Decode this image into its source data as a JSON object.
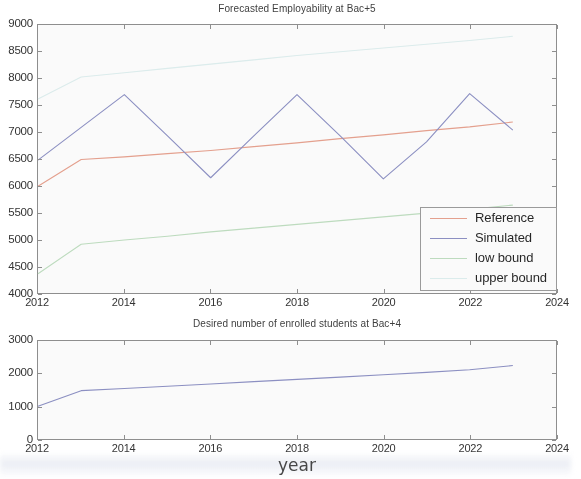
{
  "figure": {
    "background_color": "#ffffff",
    "axis_color": "#8d8d8d",
    "text_color": "#2e2e2e",
    "xaxis_label": "year"
  },
  "colors": {
    "reference": "#e8a08d",
    "simulated": "#8b8fc4",
    "low_bound": "#bfdfc0",
    "upper_bound": "#dff0f0"
  },
  "legend": {
    "items": [
      {
        "label": "Reference",
        "color_key": "reference"
      },
      {
        "label": "Simulated",
        "color_key": "simulated"
      },
      {
        "label": "low bound",
        "color_key": "low_bound"
      },
      {
        "label": "upper bound",
        "color_key": "upper_bound"
      }
    ]
  },
  "chart_data": [
    {
      "id": "top",
      "type": "line",
      "title": "Forecasted Employability at Bac+5",
      "xlabel": "",
      "ylabel": "",
      "xlim": [
        2012,
        2024
      ],
      "ylim": [
        4000,
        9000
      ],
      "xticks": [
        2012,
        2014,
        2016,
        2018,
        2020,
        2022,
        2024
      ],
      "xtick_labels": [
        "2012",
        "2014",
        "2016",
        "2018",
        "2020",
        "2022",
        "2024"
      ],
      "yticks": [
        4000,
        4500,
        5000,
        5500,
        6000,
        6500,
        7000,
        7500,
        8000,
        8500,
        9000
      ],
      "ytick_labels": [
        "4000",
        "4500",
        "5000",
        "5500",
        "6000",
        "6500",
        "7000",
        "7500",
        "8000",
        "8500",
        "9000"
      ],
      "grid": false,
      "legend_position": "lower right",
      "x": [
        2012,
        2013,
        2014,
        2015,
        2016,
        2017,
        2018,
        2019,
        2020,
        2021,
        2022,
        2023
      ],
      "series": [
        {
          "name": "Reference",
          "color": "#e8a08d",
          "values": [
            5990,
            6490,
            6540,
            6600,
            6660,
            6730,
            6800,
            6880,
            6950,
            7030,
            7100,
            7190
          ]
        },
        {
          "name": "Simulated",
          "color": "#8b8fc4",
          "values": [
            6480,
            7090,
            7700,
            6930,
            6150,
            6930,
            7700,
            6930,
            6130,
            6820,
            7720,
            7040
          ]
        },
        {
          "name": "low bound",
          "color": "#bfdfc0",
          "values": [
            4360,
            4910,
            4990,
            5060,
            5140,
            5210,
            5280,
            5350,
            5420,
            5490,
            5560,
            5640
          ]
        },
        {
          "name": "upper bound",
          "color": "#dff0f0",
          "values": [
            7620,
            8030,
            8110,
            8190,
            8270,
            8350,
            8430,
            8500,
            8570,
            8640,
            8710,
            8790
          ]
        }
      ]
    },
    {
      "id": "bottom",
      "type": "line",
      "title": "Desired number of enrolled students at Bac+4",
      "xlabel": "year",
      "ylabel": "",
      "xlim": [
        2012,
        2024
      ],
      "ylim": [
        0,
        3000
      ],
      "xticks": [
        2012,
        2014,
        2016,
        2018,
        2020,
        2022,
        2024
      ],
      "xtick_labels": [
        "2012",
        "2014",
        "2016",
        "2018",
        "2020",
        "2022",
        "2024"
      ],
      "yticks": [
        0,
        1000,
        2000,
        3000
      ],
      "ytick_labels": [
        "0",
        "1000",
        "2000",
        "3000"
      ],
      "grid": false,
      "legend_position": "none",
      "x": [
        2012,
        2013,
        2014,
        2015,
        2016,
        2017,
        2018,
        2019,
        2020,
        2021,
        2022,
        2023
      ],
      "series": [
        {
          "name": "enrolled students",
          "color": "#8b8fc4",
          "values": [
            1000,
            1480,
            1545,
            1615,
            1685,
            1755,
            1825,
            1895,
            1965,
            2040,
            2120,
            2250
          ]
        }
      ]
    }
  ]
}
